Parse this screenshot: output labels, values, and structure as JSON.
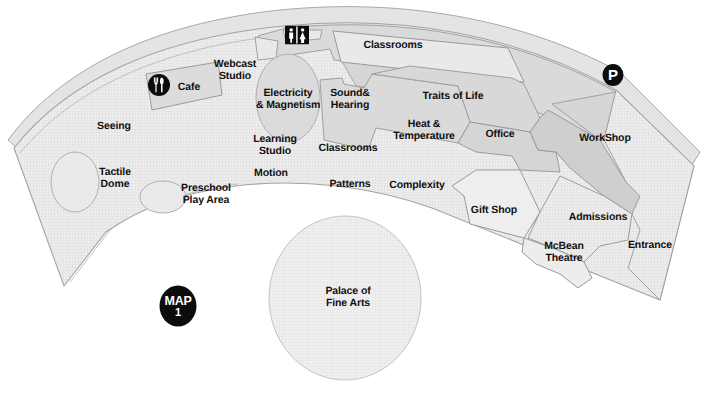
{
  "map": {
    "title": "Exploratorium Floor Plan",
    "number_badge": {
      "word": "MAP",
      "number": "1"
    },
    "colors": {
      "background": "#ffffff",
      "floor_light": "#ebebeb",
      "floor_mid": "#e2e2e2",
      "floor_dark": "#d2d2d2",
      "outline": "#9a9a9a",
      "text": "#100f10",
      "badge": "#0d0c0d"
    }
  },
  "zones": [
    {
      "id": "seeing",
      "label": "Seeing",
      "x": 114,
      "y": 126
    },
    {
      "id": "tactile-dome",
      "label": "Tactile\nDome",
      "x": 115,
      "y": 178
    },
    {
      "id": "preschool-play-area",
      "label": "Preschool\nPlay Area",
      "x": 206,
      "y": 194
    },
    {
      "id": "cafe",
      "label": "Cafe",
      "x": 189,
      "y": 87
    },
    {
      "id": "webcast-studio",
      "label": "Webcast\nStudio",
      "x": 235,
      "y": 70
    },
    {
      "id": "electricity-magnetism",
      "label": "Electricity\n& Magnetism",
      "x": 288,
      "y": 99
    },
    {
      "id": "learning-studio",
      "label": "Learning\nStudio",
      "x": 275,
      "y": 145
    },
    {
      "id": "motion",
      "label": "Motion",
      "x": 271,
      "y": 173
    },
    {
      "id": "sound-hearing",
      "label": "Sound&\nHearing",
      "x": 350,
      "y": 99
    },
    {
      "id": "classrooms-inner",
      "label": "Classrooms",
      "x": 348,
      "y": 148
    },
    {
      "id": "classrooms-outer",
      "label": "Classrooms",
      "x": 393,
      "y": 45
    },
    {
      "id": "patterns",
      "label": "Patterns",
      "x": 350,
      "y": 184
    },
    {
      "id": "complexity",
      "label": "Complexity",
      "x": 417,
      "y": 185
    },
    {
      "id": "traits-of-life",
      "label": "Traits of Life",
      "x": 453,
      "y": 96
    },
    {
      "id": "heat-temperature",
      "label": "Heat &\nTemperature",
      "x": 424,
      "y": 130
    },
    {
      "id": "office",
      "label": "Office",
      "x": 500,
      "y": 134
    },
    {
      "id": "workshop",
      "label": "WorkShop",
      "x": 605,
      "y": 138
    },
    {
      "id": "gift-shop",
      "label": "Gift Shop",
      "x": 494,
      "y": 210
    },
    {
      "id": "admissions",
      "label": "Admissions",
      "x": 598,
      "y": 217
    },
    {
      "id": "mcbean-theatre",
      "label": "McBean\nTheatre",
      "x": 564,
      "y": 252
    },
    {
      "id": "entrance",
      "label": "Entrance",
      "x": 650,
      "y": 245
    },
    {
      "id": "palace-of-fine-arts",
      "label": "Palace of\nFine Arts",
      "x": 348,
      "y": 297
    }
  ],
  "icons": [
    {
      "id": "restroom-icon",
      "name": "restroom-icon",
      "x": 297,
      "y": 37
    },
    {
      "id": "cafe-icon",
      "name": "utensils-icon",
      "x": 159,
      "y": 87
    },
    {
      "id": "parking-icon",
      "name": "parking-icon",
      "x": 613,
      "y": 75,
      "glyph": "P"
    }
  ]
}
